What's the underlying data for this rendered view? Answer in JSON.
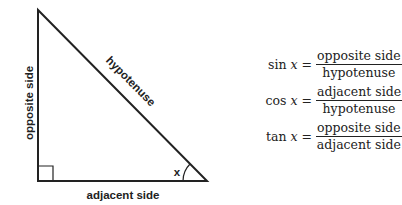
{
  "diagram": {
    "labels": {
      "opposite": "opposite side",
      "hypotenuse": "hypotenuse",
      "adjacent": "adjacent side",
      "angle": "x"
    },
    "colors": {
      "stroke": "#222222",
      "background": "#ffffff"
    }
  },
  "formulas": [
    {
      "fn": "sin",
      "var": "x",
      "eq": "=",
      "numerator": "opposite side",
      "denominator": "hypotenuse"
    },
    {
      "fn": "cos",
      "var": "x",
      "eq": "=",
      "numerator": "adjacent side",
      "denominator": "hypotenuse"
    },
    {
      "fn": "tan",
      "var": "x",
      "eq": "=",
      "numerator": "opposite side",
      "denominator": "adjacent side"
    }
  ]
}
